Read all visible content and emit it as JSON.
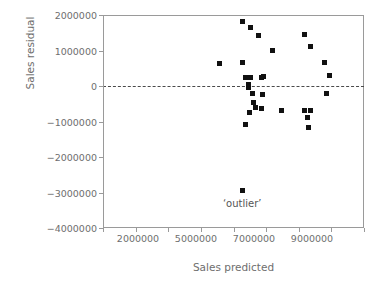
{
  "chart_data": {
    "type": "scatter",
    "title": "",
    "xlabel": "Sales predicted",
    "ylabel": "Sales residual",
    "grid": false,
    "legend": null,
    "xlim": [
      1000000,
      10000000
    ],
    "ylim": [
      -4000000,
      2000000
    ],
    "xticklabels": [
      "2000000",
      "5000000",
      "7000000",
      "9000000"
    ],
    "xtickvalues": [
      2000000,
      5000000,
      7000000,
      9000000
    ],
    "yticklabels": [
      "2000000",
      "1000000",
      "0",
      "-1000000",
      "-2000000",
      "-3000000",
      "-4000000"
    ],
    "ytickvalues": [
      2000000,
      1000000,
      0,
      -1000000,
      -2000000,
      -3000000,
      -4000000
    ],
    "reference_line": {
      "y": 0,
      "style": "dashed",
      "color": "#4a4a4a"
    },
    "marker": {
      "shape": "square",
      "color": "#111111",
      "size": 5
    },
    "annotations": [
      {
        "text": "‘outlier’",
        "x": 5800000,
        "y": -3330000
      }
    ],
    "points": [
      {
        "x": 5000000,
        "y": 620000
      },
      {
        "x": 5800000,
        "y": 1820000
      },
      {
        "x": 6100000,
        "y": 1660000
      },
      {
        "x": 6350000,
        "y": 1430000
      },
      {
        "x": 5800000,
        "y": 650000
      },
      {
        "x": 6850000,
        "y": 1000000
      },
      {
        "x": 7950000,
        "y": 1460000
      },
      {
        "x": 8150000,
        "y": 1100000
      },
      {
        "x": 8650000,
        "y": 670000
      },
      {
        "x": 8800000,
        "y": 300000
      },
      {
        "x": 5900000,
        "y": 250000
      },
      {
        "x": 6100000,
        "y": 240000
      },
      {
        "x": 6450000,
        "y": 250000
      },
      {
        "x": 6550000,
        "y": 280000
      },
      {
        "x": 6000000,
        "y": 30000
      },
      {
        "x": 6000000,
        "y": -50000
      },
      {
        "x": 6150000,
        "y": -220000
      },
      {
        "x": 6500000,
        "y": -230000
      },
      {
        "x": 6200000,
        "y": -460000
      },
      {
        "x": 6250000,
        "y": -600000
      },
      {
        "x": 6480000,
        "y": -640000
      },
      {
        "x": 6050000,
        "y": -760000
      },
      {
        "x": 5900000,
        "y": -1080000
      },
      {
        "x": 7150000,
        "y": -700000
      },
      {
        "x": 7950000,
        "y": -690000
      },
      {
        "x": 8150000,
        "y": -680000
      },
      {
        "x": 8050000,
        "y": -880000
      },
      {
        "x": 8100000,
        "y": -1170000
      },
      {
        "x": 8700000,
        "y": -200000
      },
      {
        "x": 5800000,
        "y": -2950000
      }
    ]
  },
  "axes": {
    "x_title": "Sales predicted",
    "y_title": "Sales residual"
  }
}
